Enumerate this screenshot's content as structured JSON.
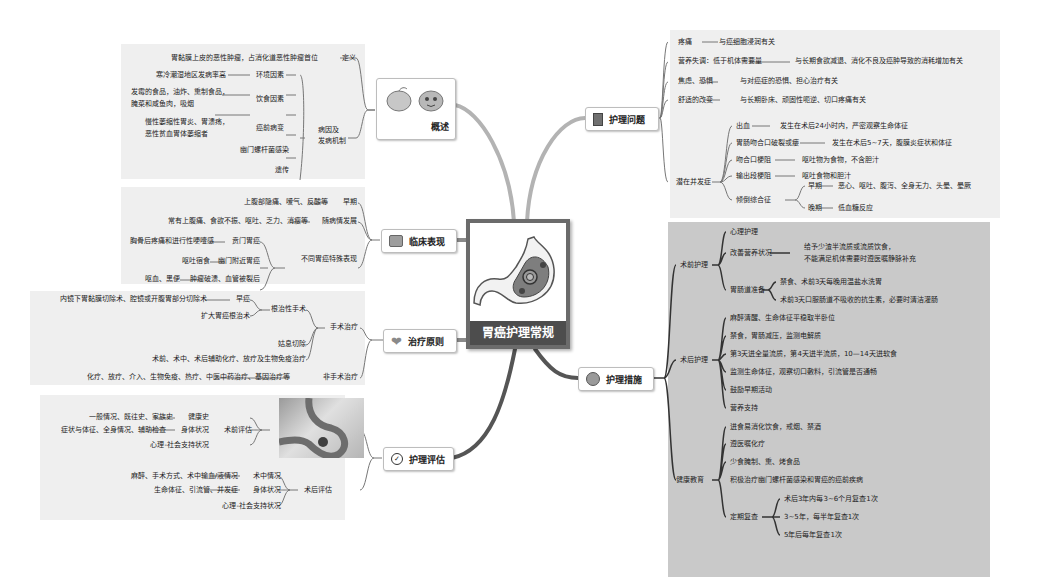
{
  "central": {
    "title": "胃癌护理常规",
    "icon": "stomach-illustration"
  },
  "overview": {
    "label": "概述",
    "icon": "stomach-cartoon-icon",
    "definition": {
      "label": "定义",
      "text": "胃黏膜上皮的恶性肿瘤，占消化道恶性肿瘤首位"
    },
    "etiology": {
      "label_line1": "病因及",
      "label_line2": "发病机制",
      "items": [
        {
          "label": "环境因素",
          "detail": "寒冷潮湿地区发病率高"
        },
        {
          "label": "饮食因素",
          "detail_line1": "发霉的食品，油炸、熏制食品，",
          "detail_line2": "腌菜和咸鱼肉，吸烟"
        },
        {
          "label": "癌前病变",
          "detail_line1": "慢性萎缩性胃炎、胃溃疡，",
          "detail_line2": "恶性贫血胃体萎缩者"
        },
        {
          "label": "幽门螺杆菌感染"
        },
        {
          "label": "遗传"
        }
      ]
    }
  },
  "clinical": {
    "label": "临床表现",
    "icon": "computer-icon",
    "early": {
      "label": "早期",
      "detail": "上腹部隐痛、嗳气、反酸等"
    },
    "progress": {
      "label": "随病情发展",
      "detail": "常有上腹痛、食欲不振、呕吐、乏力、消瘦等"
    },
    "special": {
      "label": "不同胃癌特殊表现",
      "items": [
        {
          "label": "贲门胃癌",
          "detail": "胸骨后疼痛和进行性哽噎感"
        },
        {
          "label": "幽门附近胃癌",
          "detail": "呕吐宿食"
        },
        {
          "label": "肿瘤破溃、血管被裂后",
          "detail": "呕血、黑便"
        }
      ]
    }
  },
  "treatment": {
    "label": "治疗原则",
    "icon": "heart-icon",
    "surgical": {
      "label": "手术治疗",
      "radical": {
        "label": "根治性手术",
        "early": {
          "label": "早癌",
          "detail": "内镜下胃黏膜切除术、腔镜或开腹胃部分切除术"
        },
        "extended": "扩大胃癌根治术"
      },
      "palliative": "姑息切除",
      "adjuvant": "术前、术中、术后辅助化疗、放疗及生物免疫治疗"
    },
    "nonsurgical": {
      "label": "非手术治疗",
      "detail": "化疗、放疗、介入、生物免疫、热疗、中医中药治疗、基因治疗等"
    }
  },
  "assessment": {
    "label": "护理评估",
    "icon": "check-circle-icon",
    "preop": {
      "label": "术前评估",
      "items": [
        {
          "label": "健康史",
          "detail": "一般情况、既往史、家族史"
        },
        {
          "label": "身体状况",
          "detail": "症状与体征、全身情况、辅助检查"
        },
        {
          "label": "心理-社会支持状况"
        }
      ]
    },
    "postop": {
      "label": "术后评估",
      "items": [
        {
          "label": "术中情况",
          "detail": "麻醉、手术方式、术中输血/液情况"
        },
        {
          "label": "身体状况",
          "detail": "生命体征、引流管、并发症"
        },
        {
          "label": "心理-社会支持状况"
        }
      ]
    }
  },
  "problems": {
    "label": "护理问题",
    "icon": "document-icon",
    "items": [
      {
        "label": "疼痛",
        "detail": "与癌细胞浸润有关"
      },
      {
        "label": "营养失调：低于机体需要量",
        "detail": "与长期食欲减退、消化不良及癌肿导致的消耗增加有关"
      },
      {
        "label": "焦虑、恐惧",
        "detail": "与对癌症的恐惧、担心治疗有关"
      },
      {
        "label": "舒适的改变",
        "detail": "与长期卧床、顽固性呃逆、切口疼痛有关"
      }
    ],
    "complications": {
      "label": "潜在并发症",
      "items": [
        {
          "label": "出血",
          "detail": "发生在术后24小时内，严密观察生命体征"
        },
        {
          "label": "胃肠吻合口破裂或瘘",
          "detail": "发生在术后5~7天，腹膜炎症状和体征"
        },
        {
          "label": "吻合口梗阻",
          "detail": "呕吐物为食物，不含胆汁"
        },
        {
          "label": "输出段梗阻",
          "detail": "呕吐食物和胆汁"
        }
      ],
      "dumping": {
        "label": "倾倒综合征",
        "early": {
          "label": "早期",
          "detail": "恶心、呕吐、腹泻、全身无力、头晕、晕厥"
        },
        "late": {
          "label": "晚期",
          "detail": "低血糖反应"
        }
      }
    }
  },
  "measures": {
    "label": "护理措施",
    "icon": "nurse-avatar-icon",
    "preop": {
      "label": "术前护理",
      "psych": "心理护理",
      "nutrition": {
        "label": "改善营养状况",
        "line1": "给予少渣半流质或流质饮食，",
        "line2": "不能满足机体需要时遵医嘱静脉补充"
      },
      "bowel": {
        "label": "胃肠道准备",
        "items": [
          "禁食、术前3天每晚用温盐水洗胃",
          "术前3天口服肠道不吸收的抗生素，必要时清洁灌肠"
        ]
      }
    },
    "postop": {
      "label": "术后护理",
      "items": [
        "麻醉清醒、生命体征平稳取半卧位",
        "禁食，胃肠减压，监测电解质",
        "第3天进全量流质，第4天进半流质，10—14天进软食",
        "监测生命体征，观察切口敷料，引流管是否通畅",
        "鼓励早期活动",
        "营养支持"
      ]
    },
    "education": {
      "label": "健康教育",
      "items": [
        "进食易消化饮食，戒烟、禁酒",
        "遵医嘱化疗",
        "少食腌制、熏、烤食品",
        "积极治疗幽门螺杆菌感染和胃癌的癌前疾病"
      ],
      "followup": {
        "label": "定期复查",
        "items": [
          "术后3年内每3~6个月复查1次",
          "3~5年，每半年复查1次",
          "5年后每年复查1次"
        ]
      }
    }
  },
  "colors": {
    "branch_light": "#b3b3b3",
    "branch_dark": "#555555",
    "panel_light": "#efefef",
    "panel_dark": "#c9c9c9",
    "central_border": "#6b6b6b",
    "central_label_bg": "#4d4d4d"
  }
}
